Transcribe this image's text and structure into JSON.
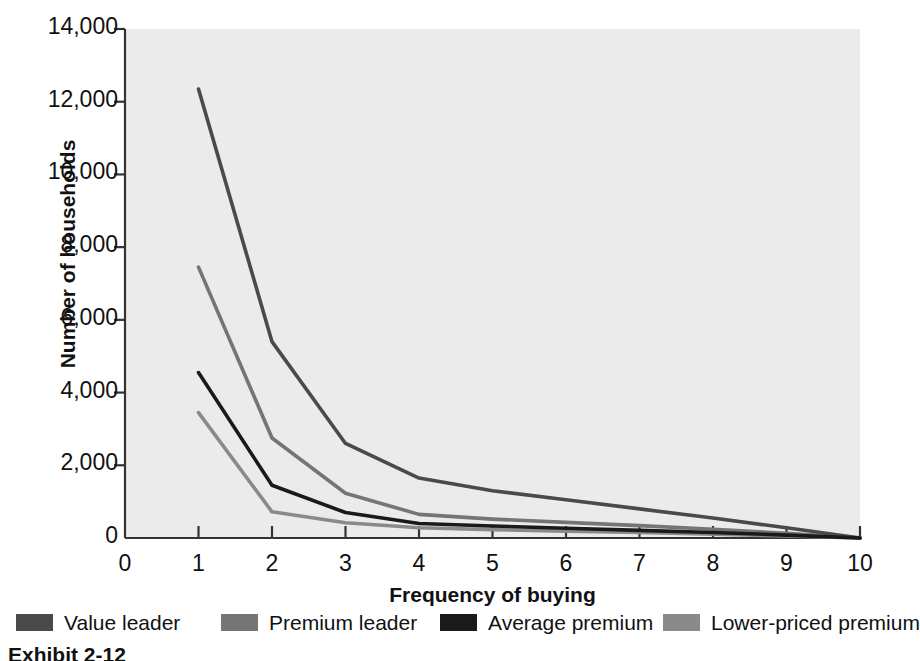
{
  "chart_data": {
    "type": "line",
    "title": "",
    "xlabel": "Frequency of buying",
    "ylabel": "Number of households",
    "xlim": [
      0,
      10
    ],
    "ylim": [
      0,
      14000
    ],
    "grid": false,
    "legend_position": "bottom",
    "plot_background": "#ebebeb",
    "x": [
      1,
      2,
      3,
      4,
      5,
      6,
      7,
      8,
      9,
      10
    ],
    "xticks": [
      "0",
      "1",
      "2",
      "3",
      "4",
      "5",
      "6",
      "7",
      "8",
      "9",
      "10"
    ],
    "xtick_values": [
      0,
      1,
      2,
      3,
      4,
      5,
      6,
      7,
      8,
      9,
      10
    ],
    "yticks": [
      "0",
      "2,000",
      "4,000",
      "6,000",
      "8,000",
      "10,000",
      "12,000",
      "14,000"
    ],
    "ytick_values": [
      0,
      2000,
      4000,
      6000,
      8000,
      10000,
      12000,
      14000
    ],
    "series": [
      {
        "name": "Value leader",
        "color": "#4a4a4a",
        "values": [
          12350,
          5400,
          2600,
          1650,
          1300,
          1050,
          800,
          550,
          280,
          0
        ]
      },
      {
        "name": "Premium leader",
        "color": "#757575",
        "values": [
          7450,
          2750,
          1230,
          650,
          520,
          430,
          340,
          240,
          130,
          0
        ]
      },
      {
        "name": "Average premium",
        "color": "#1a1a1a",
        "values": [
          4550,
          1450,
          700,
          400,
          330,
          270,
          210,
          150,
          80,
          0
        ]
      },
      {
        "name": "Lower-priced premium",
        "color": "#8a8a8a",
        "values": [
          3450,
          720,
          420,
          280,
          230,
          190,
          150,
          105,
          55,
          0
        ]
      }
    ]
  },
  "axis": {
    "y_title": "Number of households",
    "x_title": "Frequency of buying"
  },
  "legend": {
    "items": [
      {
        "label": "Value leader",
        "color": "#4a4a4a",
        "left": 8
      },
      {
        "label": "Premium leader",
        "color": "#757575",
        "left": 213
      },
      {
        "label": "Average premium",
        "color": "#1a1a1a",
        "left": 432
      },
      {
        "label": "Lower-priced premium",
        "color": "#8a8a8a",
        "left": 655
      }
    ]
  },
  "caption": {
    "text": "Exhibit 2-12"
  }
}
